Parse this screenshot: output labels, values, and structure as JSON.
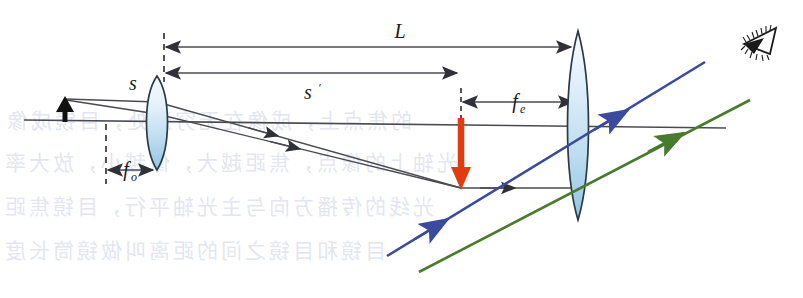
{
  "figure": {
    "background_color": "#ffffff"
  },
  "labels": {
    "object_distance": {
      "text": "s",
      "sub": ""
    },
    "image_distance": {
      "text": "s",
      "sub": "",
      "prime": "′"
    },
    "tube_length": {
      "text": "L",
      "sub": ""
    },
    "objective_focal": {
      "text": "f",
      "sub": "o"
    },
    "eyepiece_focal": {
      "text": "f",
      "sub": "e"
    }
  },
  "elements": {
    "objective_lens": {
      "name": "objective-lens",
      "fill_top": "#eef6fc",
      "fill_bottom": "#9fcbe8",
      "stroke": "#2b3a44"
    },
    "eyepiece_lens": {
      "name": "eyepiece-lens",
      "fill_top": "#eef6fc",
      "fill_bottom": "#9fcbe8",
      "stroke": "#2b3a44"
    },
    "object_arrow": {
      "name": "object-arrow",
      "color": "#111111",
      "direction": "up"
    },
    "intermediate_image_arrow": {
      "name": "intermediate-image-arrow",
      "color": "#e03c10",
      "direction": "down"
    },
    "optical_axis": {
      "name": "optical-axis",
      "color": "#4a4a52"
    },
    "ray_blue": {
      "name": "blue-ray",
      "color": "#3a4b9e"
    },
    "ray_green": {
      "name": "green-ray",
      "color": "#4a7a2e"
    },
    "ray_black": {
      "name": "black-ray",
      "color": "#4a4a52"
    },
    "eye_symbol": {
      "name": "eye-icon",
      "color": "#1a1a1a"
    }
  },
  "colors": {
    "ink": "#1a1a1a",
    "axis": "#4a4a52",
    "ray": "#4a4a52",
    "blue": "#3a4b9e",
    "green": "#4a7a2e",
    "red": "#e03c10",
    "lens_stroke": "#2b3a44",
    "lens_fill_light": "#f2f9fd",
    "lens_fill_deep": "#9ecbe8",
    "watermark": "#5566aa"
  },
  "watermark": {
    "note": "faint show-through text from reverse of printed page (mirror reversed)",
    "lines": [
      {
        "text": "的焦点上，成像在无穷远处，目镜成像",
        "x": 4,
        "y": 104
      },
      {
        "text": "光轴上的像点，焦距越大，像越小，放大率",
        "x": 2,
        "y": 146
      },
      {
        "text": "光线的传播方向与主光轴平行，目镜焦距",
        "x": 2,
        "y": 190
      },
      {
        "text": "目镜和目镜之间的距离叫做镜筒长度",
        "x": 2,
        "y": 234
      }
    ]
  },
  "geometry": {
    "optical_axis": {
      "x1": 24,
      "y1": 120,
      "x2": 726,
      "y2": 128
    },
    "objective_lens_x": 157,
    "eyepiece_lens_x": 578,
    "object_arrow": {
      "x": 64,
      "y_base": 120,
      "y_tip": 98
    },
    "image_arrow": {
      "x": 461,
      "y_base": 118,
      "y_tip": 188
    },
    "dimension_lines": [
      {
        "name": "L",
        "y": 47,
        "x_from": 165,
        "x_to": 572
      },
      {
        "name": "s-prime",
        "y": 73,
        "x_from": 165,
        "x_to": 458
      },
      {
        "name": "f-e",
        "y": 102,
        "x_from": 461,
        "x_to": 574
      },
      {
        "name": "f-o",
        "y": 170,
        "x_from": 106,
        "x_to": 155
      }
    ]
  }
}
